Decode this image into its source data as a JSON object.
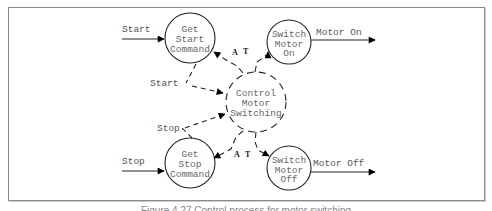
{
  "diagram": {
    "type": "data-flow / control-flow diagram",
    "processes": [
      {
        "id": "get-start",
        "lines": [
          "Get",
          "Start",
          "Command"
        ],
        "style": "solid"
      },
      {
        "id": "switch-on",
        "lines": [
          "Switch",
          "Motor",
          "On"
        ],
        "style": "solid"
      },
      {
        "id": "control",
        "lines": [
          "Control",
          "Motor",
          "Switching"
        ],
        "style": "dashed"
      },
      {
        "id": "get-stop",
        "lines": [
          "Get",
          "Stop",
          "Command"
        ],
        "style": "solid"
      },
      {
        "id": "switch-off",
        "lines": [
          "Switch",
          "Motor",
          "Off"
        ],
        "style": "solid"
      }
    ],
    "flows": {
      "start_in": "Start",
      "stop_in": "Stop",
      "motor_on_out": "Motor On",
      "motor_off_out": "Motor Off",
      "start_event": "Start",
      "stop_event": "Stop"
    },
    "prompt_labels": {
      "top_a": "A",
      "top_t": "T",
      "bottom_a": "A",
      "bottom_t": "T"
    }
  },
  "caption": "Figure 4.27 Control process for motor switching"
}
